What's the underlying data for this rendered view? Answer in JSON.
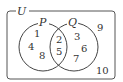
{
  "diagram": {
    "type": "venn",
    "universe": {
      "label": "U",
      "outside_elements": [
        {
          "value": "9",
          "x": 99,
          "y": 31
        },
        {
          "value": "10",
          "x": 101,
          "y": 74
        }
      ]
    },
    "sets": [
      {
        "label": "P",
        "center": [
          43,
          47
        ],
        "radius": 24,
        "only_elements": [
          {
            "value": "1",
            "x": 37,
            "y": 37
          },
          {
            "value": "4",
            "x": 31,
            "y": 50
          },
          {
            "value": "8",
            "x": 42,
            "y": 59
          }
        ]
      },
      {
        "label": "Q",
        "center": [
          74,
          47
        ],
        "radius": 24,
        "only_elements": [
          {
            "value": "3",
            "x": 77,
            "y": 40
          },
          {
            "value": "6",
            "x": 84,
            "y": 52
          },
          {
            "value": "7",
            "x": 76,
            "y": 62
          }
        ]
      }
    ],
    "intersection": {
      "label": "P∩Q",
      "elements": [
        {
          "value": "2",
          "x": 59,
          "y": 43
        },
        {
          "value": "5",
          "x": 59,
          "y": 55
        }
      ]
    },
    "colors": {
      "stroke": "#444444",
      "text": "#333333",
      "background": "#ffffff"
    }
  }
}
